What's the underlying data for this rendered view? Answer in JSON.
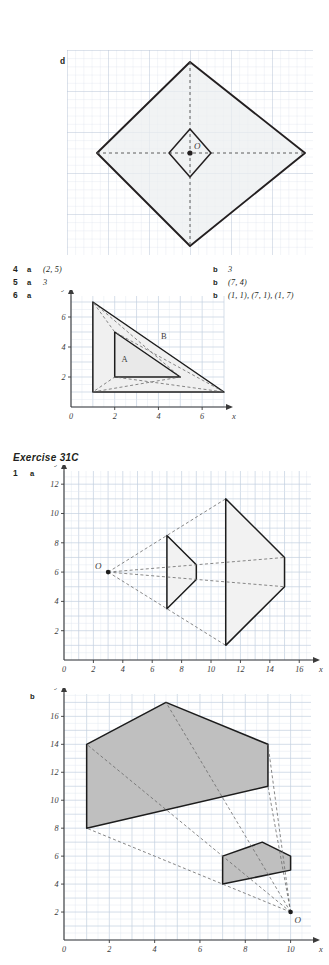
{
  "page": {
    "background": "#ffffff",
    "ink": "#231f20",
    "grid_color": "#c9d4e2",
    "fill_color": "#d9d9d9",
    "fill_light": "#efefef"
  },
  "top_figure": {
    "label": "d",
    "origin_label": "O",
    "outer_shape": "kite",
    "outer_points": "centre-top, right, centre-bottom, left",
    "inner_shape": "kite"
  },
  "answers": [
    {
      "number": "4",
      "a_key": "a",
      "a_value": "(2, 5)",
      "b_key": "b",
      "b_value": "3"
    },
    {
      "number": "5",
      "a_key": "a",
      "a_value": "3",
      "b_key": "b",
      "b_value": "(7, 4)"
    },
    {
      "number": "6",
      "a_key": "a",
      "a_value": "",
      "b_key": "b",
      "b_value": "(1, 1), (7, 1), (1, 7)"
    }
  ],
  "exercise": {
    "title": "Exercise 31C"
  },
  "chart_data": [
    {
      "id": "fig-6a",
      "type": "scatter",
      "title": "",
      "question_number": "6",
      "part": "a",
      "xlabel": "x",
      "ylabel": "y",
      "xlim": [
        0,
        7
      ],
      "ylim": [
        0,
        7.4
      ],
      "xticks": [
        0,
        2,
        4,
        6
      ],
      "yticks": [
        2,
        4,
        6
      ],
      "grid": true,
      "annotations": [
        {
          "text": "A",
          "x": 2.45,
          "y": 3.0
        },
        {
          "text": "B",
          "x": 4.25,
          "y": 4.55
        }
      ],
      "shapes": [
        {
          "name": "triangle-B",
          "style": "solid",
          "points": [
            [
              1,
              1
            ],
            [
              1,
              7
            ],
            [
              7,
              1
            ]
          ]
        },
        {
          "name": "triangle-A",
          "style": "solid",
          "points": [
            [
              2,
              2
            ],
            [
              2,
              5
            ],
            [
              5,
              2
            ]
          ]
        },
        {
          "name": "rays",
          "style": "dashed",
          "points": [
            [
              1,
              1
            ],
            [
              5,
              2
            ],
            [
              1,
              7
            ],
            [
              2,
              5
            ],
            [
              7,
              1
            ],
            [
              2,
              2
            ],
            [
              1,
              1
            ]
          ]
        }
      ]
    },
    {
      "id": "fig-1a",
      "type": "scatter",
      "title": "",
      "question_number": "1",
      "part": "a",
      "xlabel": "x",
      "ylabel": "y",
      "xlim": [
        0,
        16.8
      ],
      "ylim": [
        0,
        12.9
      ],
      "xticks": [
        0,
        2,
        4,
        6,
        8,
        10,
        12,
        14,
        16
      ],
      "yticks": [
        2,
        4,
        6,
        8,
        10,
        12
      ],
      "grid": true,
      "centre_of_enlargement": {
        "label": "O",
        "x": 3,
        "y": 6
      },
      "shapes": [
        {
          "name": "object-small",
          "style": "solid",
          "points": [
            [
              7,
              8.5
            ],
            [
              7,
              3.5
            ],
            [
              9,
              5.5
            ],
            [
              9,
              6.5
            ]
          ]
        },
        {
          "name": "image-large",
          "style": "solid",
          "points": [
            [
              11,
              11
            ],
            [
              11,
              1
            ],
            [
              15,
              5
            ],
            [
              15,
              7
            ]
          ]
        },
        {
          "name": "ray-1",
          "style": "dashed",
          "points": [
            [
              3,
              6
            ],
            [
              11,
              11
            ]
          ]
        },
        {
          "name": "ray-2",
          "style": "dashed",
          "points": [
            [
              3,
              6
            ],
            [
              11,
              1
            ]
          ]
        },
        {
          "name": "ray-3",
          "style": "dashed",
          "points": [
            [
              3,
              6
            ],
            [
              15,
              5
            ]
          ]
        },
        {
          "name": "ray-4",
          "style": "dashed",
          "points": [
            [
              3,
              6
            ],
            [
              15,
              7
            ]
          ]
        }
      ]
    },
    {
      "id": "fig-1b",
      "type": "scatter",
      "title": "",
      "question_number": "1",
      "part": "b",
      "xlabel": "x",
      "ylabel": "y",
      "xlim": [
        0,
        10.9
      ],
      "ylim": [
        0,
        17.6
      ],
      "xticks": [
        0,
        2,
        4,
        6,
        8,
        10
      ],
      "yticks": [
        2,
        4,
        6,
        8,
        10,
        12,
        14,
        16
      ],
      "grid": true,
      "centre_of_enlargement": {
        "label": "O",
        "x": 10,
        "y": 2
      },
      "shapes": [
        {
          "name": "image-large",
          "style": "solid",
          "points": [
            [
              1,
              8
            ],
            [
              1,
              14
            ],
            [
              4.5,
              17
            ],
            [
              9,
              14
            ],
            [
              9,
              11
            ]
          ]
        },
        {
          "name": "object-small",
          "style": "solid",
          "points": [
            [
              7,
              4
            ],
            [
              7,
              6
            ],
            [
              8.75,
              7
            ],
            [
              10,
              6
            ],
            [
              10,
              5
            ]
          ]
        },
        {
          "name": "ray-1",
          "style": "dashed",
          "points": [
            [
              10,
              2
            ],
            [
              1,
              8
            ]
          ]
        },
        {
          "name": "ray-2",
          "style": "dashed",
          "points": [
            [
              10,
              2
            ],
            [
              1,
              14
            ]
          ]
        },
        {
          "name": "ray-3",
          "style": "dashed",
          "points": [
            [
              10,
              2
            ],
            [
              4.5,
              17
            ]
          ]
        },
        {
          "name": "ray-4",
          "style": "dashed",
          "points": [
            [
              10,
              2
            ],
            [
              9,
              14
            ]
          ]
        },
        {
          "name": "ray-5",
          "style": "dashed",
          "points": [
            [
              10,
              2
            ],
            [
              9,
              11
            ]
          ]
        }
      ]
    }
  ]
}
